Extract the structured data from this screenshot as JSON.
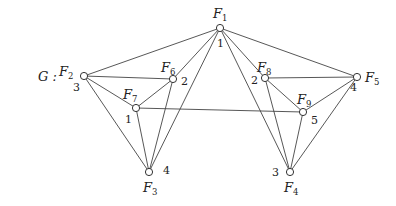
{
  "graph_label": "G :",
  "nodes": [
    {
      "id": "F1",
      "name": "F",
      "sub": "1",
      "number": "1"
    },
    {
      "id": "F2",
      "name": "F",
      "sub": "2",
      "number": "3"
    },
    {
      "id": "F3",
      "name": "F",
      "sub": "3",
      "number": "4"
    },
    {
      "id": "F4",
      "name": "F",
      "sub": "4",
      "number": "3"
    },
    {
      "id": "F5",
      "name": "F",
      "sub": "5",
      "number": "4"
    },
    {
      "id": "F6",
      "name": "F",
      "sub": "6",
      "number": "2"
    },
    {
      "id": "F7",
      "name": "F",
      "sub": "7",
      "number": "1"
    },
    {
      "id": "F8",
      "name": "F",
      "sub": "8",
      "number": "2"
    },
    {
      "id": "F9",
      "name": "F",
      "sub": "9",
      "number": "5"
    }
  ],
  "edges": [
    [
      "F1",
      "F2"
    ],
    [
      "F1",
      "F6"
    ],
    [
      "F1",
      "F3"
    ],
    [
      "F1",
      "F4"
    ],
    [
      "F1",
      "F8"
    ],
    [
      "F1",
      "F5"
    ],
    [
      "F2",
      "F6"
    ],
    [
      "F2",
      "F7"
    ],
    [
      "F2",
      "F3"
    ],
    [
      "F6",
      "F7"
    ],
    [
      "F6",
      "F3"
    ],
    [
      "F7",
      "F3"
    ],
    [
      "F7",
      "F9"
    ],
    [
      "F8",
      "F5"
    ],
    [
      "F8",
      "F9"
    ],
    [
      "F8",
      "F4"
    ],
    [
      "F9",
      "F5"
    ],
    [
      "F9",
      "F4"
    ],
    [
      "F5",
      "F4"
    ]
  ]
}
